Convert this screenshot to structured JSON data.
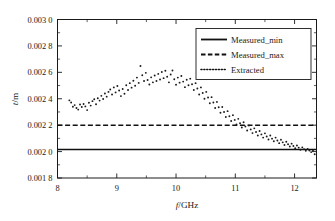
{
  "chart_data": {
    "type": "scatter",
    "title": "",
    "xlabel": "f/GHz",
    "ylabel": "t/m",
    "xlabel_italic": "f",
    "xlabel_rest": "/GHz",
    "ylabel_italic": "t",
    "ylabel_rest": "/m",
    "xlim": [
      8,
      12.37
    ],
    "ylim": [
      0.0018,
      0.003
    ],
    "grid": false,
    "legend_position": "top-right",
    "xticks": [
      8,
      9,
      10,
      11,
      12
    ],
    "xtick_labels": [
      "8",
      "9",
      "10",
      "11",
      "12"
    ],
    "yticks": [
      0.0018,
      0.002,
      0.0022,
      0.0024,
      0.0026,
      0.0028,
      0.003
    ],
    "ytick_labels": [
      "0.001 8",
      "0.002 0",
      "0.002 2",
      "0.002 4",
      "0.002 6",
      "0.002 8",
      "0.003 0"
    ],
    "series": [
      {
        "name": "Measured_min",
        "style": "solid",
        "type": "constant",
        "value": 0.002015,
        "x_range": [
          8,
          12.37
        ]
      },
      {
        "name": "Measured_max",
        "style": "dashed",
        "type": "constant",
        "value": 0.0022,
        "x_range": [
          8,
          12.37
        ]
      },
      {
        "name": "Extracted",
        "style": "dotted",
        "type": "scatter",
        "points": [
          [
            8.2,
            0.002388
          ],
          [
            8.23,
            0.002372
          ],
          [
            8.26,
            0.00234
          ],
          [
            8.29,
            0.002352
          ],
          [
            8.32,
            0.00233
          ],
          [
            8.35,
            0.002318
          ],
          [
            8.38,
            0.002356
          ],
          [
            8.41,
            0.002338
          ],
          [
            8.44,
            0.00236
          ],
          [
            8.47,
            0.002342
          ],
          [
            8.5,
            0.002314
          ],
          [
            8.53,
            0.00237
          ],
          [
            8.56,
            0.002348
          ],
          [
            8.59,
            0.002382
          ],
          [
            8.62,
            0.002396
          ],
          [
            8.65,
            0.002358
          ],
          [
            8.68,
            0.002404
          ],
          [
            8.71,
            0.002386
          ],
          [
            8.74,
            0.002422
          ],
          [
            8.77,
            0.002398
          ],
          [
            8.8,
            0.00244
          ],
          [
            8.83,
            0.002416
          ],
          [
            8.86,
            0.002452
          ],
          [
            8.89,
            0.00247
          ],
          [
            8.92,
            0.002432
          ],
          [
            8.95,
            0.002486
          ],
          [
            8.98,
            0.002448
          ],
          [
            9.01,
            0.002496
          ],
          [
            9.04,
            0.002462
          ],
          [
            9.07,
            0.00242
          ],
          [
            9.1,
            0.002474
          ],
          [
            9.13,
            0.002438
          ],
          [
            9.16,
            0.002502
          ],
          [
            9.19,
            0.002466
          ],
          [
            9.22,
            0.002518
          ],
          [
            9.25,
            0.002484
          ],
          [
            9.28,
            0.002536
          ],
          [
            9.31,
            0.002498
          ],
          [
            9.34,
            0.00256
          ],
          [
            9.37,
            0.00252
          ],
          [
            9.4,
            0.002648
          ],
          [
            9.43,
            0.002578
          ],
          [
            9.46,
            0.002534
          ],
          [
            9.49,
            0.002596
          ],
          [
            9.52,
            0.002542
          ],
          [
            9.55,
            0.002508
          ],
          [
            9.58,
            0.002562
          ],
          [
            9.61,
            0.002524
          ],
          [
            9.64,
            0.002576
          ],
          [
            9.67,
            0.002534
          ],
          [
            9.7,
            0.002588
          ],
          [
            9.73,
            0.002546
          ],
          [
            9.76,
            0.002602
          ],
          [
            9.79,
            0.002556
          ],
          [
            9.82,
            0.002612
          ],
          [
            9.85,
            0.002566
          ],
          [
            9.88,
            0.002524
          ],
          [
            9.91,
            0.002584
          ],
          [
            9.94,
            0.002614
          ],
          [
            9.97,
            0.002548
          ],
          [
            10.0,
            0.002506
          ],
          [
            10.03,
            0.00256
          ],
          [
            10.06,
            0.002522
          ],
          [
            10.09,
            0.002572
          ],
          [
            10.12,
            0.00253
          ],
          [
            10.15,
            0.002488
          ],
          [
            10.18,
            0.002544
          ],
          [
            10.21,
            0.002502
          ],
          [
            10.24,
            0.002552
          ],
          [
            10.27,
            0.00251
          ],
          [
            10.3,
            0.002466
          ],
          [
            10.33,
            0.002518
          ],
          [
            10.36,
            0.002478
          ],
          [
            10.39,
            0.002432
          ],
          [
            10.42,
            0.002486
          ],
          [
            10.45,
            0.002444
          ],
          [
            10.48,
            0.0024
          ],
          [
            10.51,
            0.002452
          ],
          [
            10.54,
            0.00241
          ],
          [
            10.57,
            0.002366
          ],
          [
            10.6,
            0.002412
          ],
          [
            10.63,
            0.002372
          ],
          [
            10.66,
            0.00233
          ],
          [
            10.69,
            0.002376
          ],
          [
            10.72,
            0.002336
          ],
          [
            10.75,
            0.002294
          ],
          [
            10.78,
            0.002338
          ],
          [
            10.81,
            0.0023
          ],
          [
            10.84,
            0.002262
          ],
          [
            10.87,
            0.002306
          ],
          [
            10.9,
            0.002268
          ],
          [
            10.93,
            0.002232
          ],
          [
            10.96,
            0.002276
          ],
          [
            10.99,
            0.00224
          ],
          [
            11.02,
            0.002206
          ],
          [
            11.05,
            0.002248
          ],
          [
            11.08,
            0.002214
          ],
          [
            11.11,
            0.002182
          ],
          [
            11.14,
            0.002222
          ],
          [
            11.17,
            0.00219
          ],
          [
            11.2,
            0.00216
          ],
          [
            11.23,
            0.002198
          ],
          [
            11.26,
            0.002168
          ],
          [
            11.29,
            0.00214
          ],
          [
            11.32,
            0.002176
          ],
          [
            11.35,
            0.002148
          ],
          [
            11.38,
            0.002122
          ],
          [
            11.41,
            0.002156
          ],
          [
            11.44,
            0.00213
          ],
          [
            11.47,
            0.002106
          ],
          [
            11.5,
            0.002138
          ],
          [
            11.53,
            0.002114
          ],
          [
            11.56,
            0.002092
          ],
          [
            11.59,
            0.002122
          ],
          [
            11.62,
            0.002098
          ],
          [
            11.65,
            0.002078
          ],
          [
            11.68,
            0.002106
          ],
          [
            11.71,
            0.002084
          ],
          [
            11.74,
            0.002064
          ],
          [
            11.77,
            0.00209
          ],
          [
            11.8,
            0.00207
          ],
          [
            11.83,
            0.00205
          ],
          [
            11.86,
            0.002074
          ],
          [
            11.89,
            0.002056
          ],
          [
            11.92,
            0.002038
          ],
          [
            11.95,
            0.00206
          ],
          [
            11.98,
            0.002042
          ],
          [
            12.01,
            0.002026
          ],
          [
            12.04,
            0.002046
          ],
          [
            12.07,
            0.00203
          ],
          [
            12.1,
            0.002014
          ],
          [
            12.13,
            0.002032
          ],
          [
            12.16,
            0.002018
          ],
          [
            12.19,
            0.002006
          ],
          [
            12.22,
            0.00202
          ],
          [
            12.25,
            0.002008
          ],
          [
            12.28,
            0.001996
          ],
          [
            12.31,
            0.002006
          ],
          [
            12.34,
            0.00198
          ]
        ]
      }
    ],
    "legend": [
      {
        "label": "Measured_min",
        "style": "solid"
      },
      {
        "label": "Measured_max",
        "style": "dashed"
      },
      {
        "label": "Extracted",
        "style": "dotted"
      }
    ]
  }
}
